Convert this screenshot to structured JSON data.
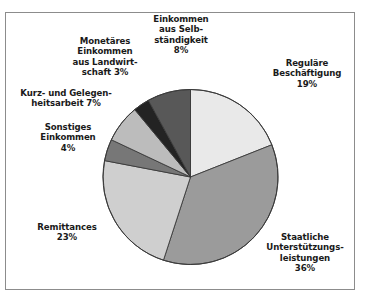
{
  "figure": {
    "frame_color": "#8c8c8c",
    "background": "#ffffff"
  },
  "chart_data": {
    "type": "pie",
    "title": "",
    "subtitle": "",
    "xlabel": "",
    "ylabel": "",
    "grid": false,
    "legend_position": "none",
    "units": "percent",
    "total": 100,
    "start_angle_deg": 0,
    "direction": "clockwise",
    "categories": [
      "Reguläre Beschäftigung",
      "Staatliche Unterstützungsleistungen",
      "Remittances",
      "Sonstiges Einkommen",
      "Kurz- und Gelegenheitsarbeit",
      "Monetäres Einkommen aus Landwirtschaft",
      "Einkommen aus Selbständigkeit"
    ],
    "values": [
      19,
      36,
      23,
      4,
      7,
      3,
      8
    ],
    "colors": [
      "#e9e9e9",
      "#9b9b9b",
      "#cfcfcf",
      "#777777",
      "#bcbcbc",
      "#232323",
      "#585858"
    ],
    "slice_edge_color": "#3a3a3a",
    "slices": [
      {
        "name": "Reguläre Beschäftigung",
        "value": 19,
        "value_label": "19%",
        "color": "#e9e9e9",
        "label_lines": [
          "Reguläre",
          "Beschäftigung",
          "19%"
        ]
      },
      {
        "name": "Staatliche Unterstützungsleistungen",
        "value": 36,
        "value_label": "36%",
        "color": "#9b9b9b",
        "label_lines": [
          "Staatliche",
          "Unterstützungs-",
          "leistungen",
          "36%"
        ]
      },
      {
        "name": "Remittances",
        "value": 23,
        "value_label": "23%",
        "color": "#cfcfcf",
        "label_lines": [
          "Remittances",
          "23%"
        ]
      },
      {
        "name": "Sonstiges Einkommen",
        "value": 4,
        "value_label": "4%",
        "color": "#777777",
        "label_lines": [
          "Sonstiges",
          "Einkommen",
          "4%"
        ]
      },
      {
        "name": "Kurz- und Gelegenheitsarbeit",
        "value": 7,
        "value_label": "7%",
        "color": "#bcbcbc",
        "label_lines": [
          "Kurz- und Gelegen-",
          "heitsarbeit  7%"
        ]
      },
      {
        "name": "Monetäres Einkommen aus Landwirtschaft",
        "value": 3,
        "value_label": "3%",
        "color": "#232323",
        "label_lines": [
          "Monetäres",
          "Einkommen",
          "aus Landwirt-",
          "schaft  3%"
        ]
      },
      {
        "name": "Einkommen aus Selbständigkeit",
        "value": 8,
        "value_label": "8%",
        "color": "#585858",
        "label_lines": [
          "Einkommen",
          "aus Selb-",
          "ständigkeit",
          "8%"
        ]
      }
    ]
  },
  "labels": {
    "regulaere": "Reguläre\nBeschäftigung\n19%",
    "staatliche": "Staatliche\nUnterstützungs-\nleistungen\n36%",
    "remittances": "Remittances\n23%",
    "sonstiges": "Sonstiges\nEinkommen\n4%",
    "gelegenheit": "Kurz- und Gelegen-\nheitsarbeit  7%",
    "landwirtschaft": "Monetäres\nEinkommen\naus Landwirt-\nschaft  3%",
    "selbstaendigkeit": "Einkommen\naus Selb-\nständigkeit\n8%"
  }
}
